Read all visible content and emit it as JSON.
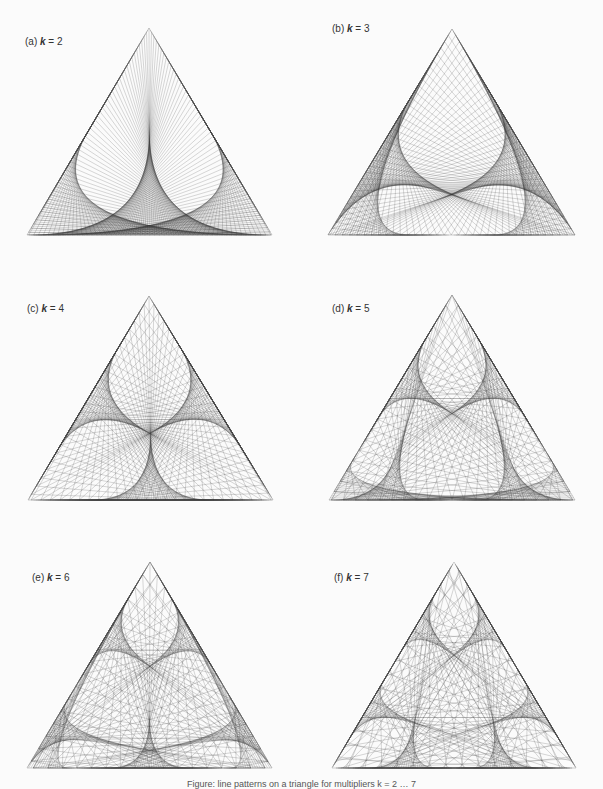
{
  "figure": {
    "background": "#fbfbfb",
    "line_color": "#2a2a2a",
    "caption": "Figure: line patterns on a triangle for multipliers k = 2 … 7"
  },
  "chart_data": {
    "type": "diagram",
    "n_points": 300,
    "panels": [
      {
        "id": "a",
        "label_prefix": "(a)",
        "k": 2,
        "label_suffix": " = 2",
        "vertices": [
          [
            149,
            28
          ],
          [
            272,
            235
          ],
          [
            27,
            235
          ]
        ],
        "label_pos": [
          25,
          36
        ]
      },
      {
        "id": "b",
        "label_prefix": "(b)",
        "k": 3,
        "label_suffix": " = 3",
        "vertices": [
          [
            452,
            29
          ],
          [
            575,
            235
          ],
          [
            328,
            235
          ]
        ],
        "label_pos": [
          332,
          23
        ]
      },
      {
        "id": "c",
        "label_prefix": "(c)",
        "k": 4,
        "label_suffix": " = 4",
        "vertices": [
          [
            149,
            296
          ],
          [
            273,
            500
          ],
          [
            28,
            500
          ]
        ],
        "label_pos": [
          27,
          303
        ]
      },
      {
        "id": "d",
        "label_prefix": "(d)",
        "k": 5,
        "label_suffix": " = 5",
        "vertices": [
          [
            452,
            295
          ],
          [
            575,
            500
          ],
          [
            329,
            500
          ]
        ],
        "label_pos": [
          332,
          303
        ]
      },
      {
        "id": "e",
        "label_prefix": "(e)",
        "k": 6,
        "label_suffix": " = 6",
        "vertices": [
          [
            150,
            562
          ],
          [
            272,
            768
          ],
          [
            27,
            768
          ]
        ],
        "label_pos": [
          32,
          572
        ]
      },
      {
        "id": "f",
        "label_prefix": "(f)",
        "k": 7,
        "label_suffix": " = 7",
        "vertices": [
          [
            454,
            562
          ],
          [
            576,
            768
          ],
          [
            332,
            768
          ]
        ],
        "label_pos": [
          334,
          572
        ]
      }
    ]
  }
}
